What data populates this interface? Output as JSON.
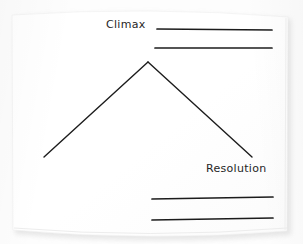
{
  "document": {
    "type": "worksheet",
    "medium": "scanned-paper",
    "title": "Plot Diagram",
    "page_color": "#ffffff",
    "ink_color": "#1c1c1c"
  },
  "labels": [
    {
      "id": "climax",
      "text": "Climax",
      "x": 106,
      "y": 19
    },
    {
      "id": "resolution",
      "text": "Resolution",
      "x": 206,
      "y": 163
    }
  ],
  "diagram": {
    "name": "story-arc",
    "stroke_color": "#1c1c1c",
    "stroke_width": 1.4,
    "points": {
      "left_start": {
        "x": 44,
        "y": 157
      },
      "apex": {
        "x": 148,
        "y": 62
      },
      "right_end": {
        "x": 252,
        "y": 157
      }
    },
    "segments": [
      {
        "name": "rising-action",
        "from": "left_start",
        "to": "apex"
      },
      {
        "name": "falling-action",
        "from": "apex",
        "to": "right_end"
      }
    ]
  },
  "answer_lines": [
    {
      "id": "line-1",
      "group": "climax",
      "x1": 157,
      "y1": 29,
      "x2": 272,
      "y2": 30
    },
    {
      "id": "line-2",
      "group": "climax",
      "x1": 155,
      "y1": 48,
      "x2": 272,
      "y2": 48
    },
    {
      "id": "line-3",
      "group": "resolution",
      "x1": 152,
      "y1": 199,
      "x2": 273,
      "y2": 197
    },
    {
      "id": "line-4",
      "group": "resolution",
      "x1": 152,
      "y1": 220,
      "x2": 273,
      "y2": 218
    }
  ],
  "page_geometry": {
    "left": 11,
    "top": 11,
    "width": 278,
    "height": 223,
    "top_edge_curve": "slightly bowed upward",
    "bottom_edge_curve": "slightly bowed downward",
    "shadow_color": "#e9e9e9",
    "background_color": "#fdfdfd"
  }
}
